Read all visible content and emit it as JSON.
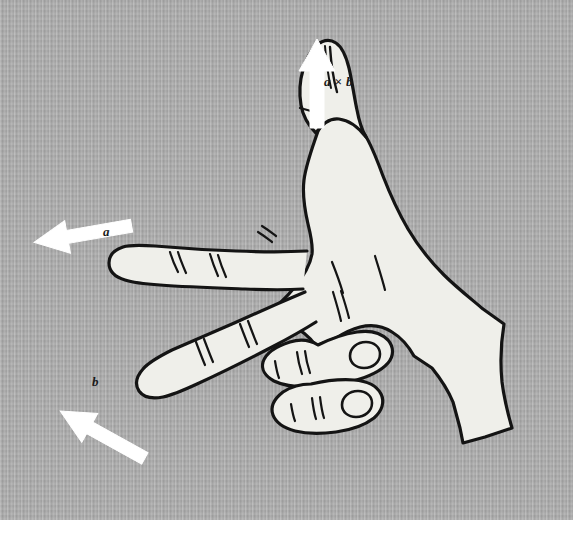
{
  "figure": {
    "background_color": "#a9a9a9",
    "hand_fill_color": "#eeeeea",
    "hand_outline_color": "#141414",
    "arrow_color": "#ffffff",
    "label_color": "#1a1a1a",
    "canvas": {
      "width": 573,
      "height": 539,
      "art_height": 520
    }
  },
  "labels": {
    "cross": "a × b",
    "a": "a",
    "b": "b"
  },
  "vectors": [
    {
      "id": "a",
      "label": "a",
      "meaning": "index finger direction",
      "direction": "left and slightly up",
      "angle_degrees": 172,
      "arrow_tip": {
        "x": 36,
        "y": 238
      },
      "arrow_tail": {
        "x": 130,
        "y": 256
      }
    },
    {
      "id": "b",
      "label": "b",
      "meaning": "middle finger direction",
      "direction": "down and to the left",
      "angle_degrees": 215,
      "arrow_tip": {
        "x": 62,
        "y": 415
      },
      "arrow_tail": {
        "x": 146,
        "y": 368
      }
    },
    {
      "id": "a-cross-b",
      "label": "a × b",
      "meaning": "thumb direction, perpendicular to a and b",
      "direction": "up",
      "angle_degrees": 90,
      "arrow_tip": {
        "x": 317,
        "y": 40
      },
      "arrow_tail": {
        "x": 317,
        "y": 128
      }
    }
  ],
  "hand": {
    "side": "right",
    "pose": "index finger extended left, middle finger extended down-left, thumb up, ring and little fingers folded",
    "parts": [
      "index-finger",
      "middle-finger",
      "thumb",
      "folded-ring-finger",
      "folded-little-finger",
      "palm",
      "wrist"
    ]
  }
}
